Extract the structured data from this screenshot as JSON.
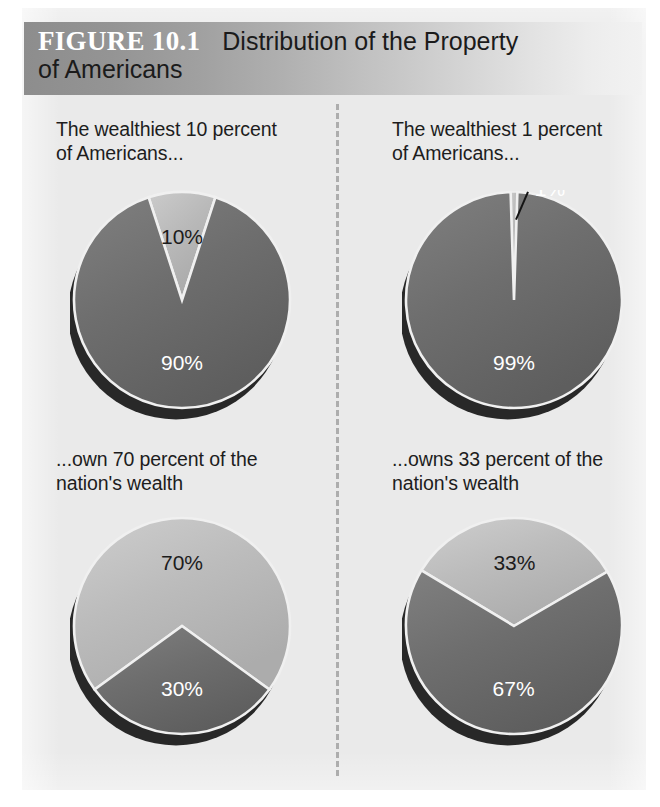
{
  "header": {
    "figure_number": "FIGURE 10.1",
    "title_line_1": "Distribution of the Property",
    "title_line_2": "of Americans",
    "gradient_from": "#8d8d8d",
    "gradient_to": "#f2f2f2",
    "number_color": "#ffffff",
    "title_color": "#1b1b1b"
  },
  "palette": {
    "page_background": "#eaeaea",
    "slice_dark": "#6e6e6e",
    "slice_light": "#b9b9b9",
    "shadow": "#1e1e1e",
    "separator": "#f0f0f0",
    "divider": "#adadad"
  },
  "captions": {
    "top_left": "The wealthiest 10 percent\nof Americans...",
    "top_right": "The wealthiest 1 percent\nof Americans...",
    "bottom_left": "...own 70 percent of the\nnation's wealth",
    "bottom_right": "...owns 33 percent of the\nnation's wealth"
  },
  "chart_data": [
    {
      "id": "population-10-percent",
      "type": "pie",
      "title": "The wealthiest 10 percent of Americans...",
      "position": "top-left",
      "labels": [
        "10%",
        "90%"
      ],
      "values": [
        10,
        90
      ],
      "colors": [
        "#b9b9b9",
        "#6e6e6e"
      ],
      "label_colors": [
        "#1c1c1c",
        "#ffffff"
      ],
      "start_angle_deg": -18,
      "legend": "none"
    },
    {
      "id": "population-1-percent",
      "type": "pie",
      "title": "The wealthiest 1 percent of Americans...",
      "position": "top-right",
      "labels": [
        "1%",
        "99%"
      ],
      "values": [
        1,
        99
      ],
      "colors": [
        "#b9b9b9",
        "#6e6e6e"
      ],
      "label_colors": [
        "#ffffff",
        "#ffffff"
      ],
      "start_angle_deg": -1.8,
      "legend": "none",
      "callout": true
    },
    {
      "id": "wealth-70-percent",
      "type": "pie",
      "title": "...own 70 percent of the nation's wealth",
      "position": "bottom-left",
      "labels": [
        "70%",
        "30%"
      ],
      "values": [
        70,
        30
      ],
      "colors": [
        "#bcbcbc",
        "#6e6e6e"
      ],
      "label_colors": [
        "#1c1c1c",
        "#ffffff"
      ],
      "start_angle_deg": -126,
      "legend": "none"
    },
    {
      "id": "wealth-33-percent",
      "type": "pie",
      "title": "...owns 33 percent of the nation's wealth",
      "position": "bottom-right",
      "labels": [
        "33%",
        "67%"
      ],
      "values": [
        33,
        67
      ],
      "colors": [
        "#bcbcbc",
        "#6e6e6e"
      ],
      "label_colors": [
        "#1c1c1c",
        "#ffffff"
      ],
      "start_angle_deg": -59,
      "legend": "none"
    }
  ]
}
